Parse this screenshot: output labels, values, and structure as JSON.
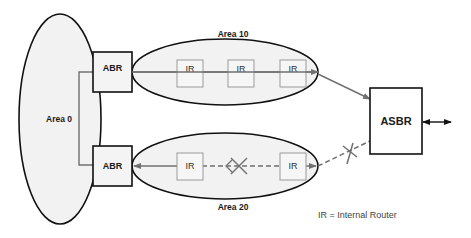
{
  "diagram": {
    "areas": [
      {
        "id": "area0",
        "label": "Area 0"
      },
      {
        "id": "area10",
        "label": "Area 10"
      },
      {
        "id": "area20",
        "label": "Area 20"
      }
    ],
    "routers": {
      "abr_top": "ABR",
      "abr_bottom": "ABR",
      "asbr": "ASBR",
      "ir_top": [
        "IR",
        "IR",
        "IR"
      ],
      "ir_bottom": [
        "IR",
        "IR"
      ]
    },
    "legend": "IR = Internal Router",
    "colors": {
      "area_fill": "#f2f2f2",
      "outline": "#111111",
      "path": "#707070",
      "ir_border": "#9a9a9a"
    }
  }
}
